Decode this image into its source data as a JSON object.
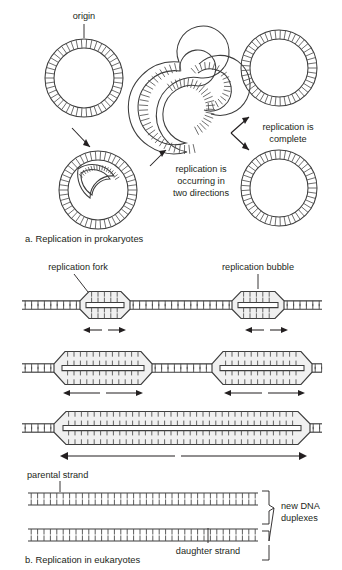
{
  "figure": {
    "title_a": "a. Replication in prokaryotes",
    "title_b": "b. Replication in eukaryotes"
  },
  "panel_a": {
    "labels": {
      "origin": "origin",
      "two_directions_line1": "replication is",
      "two_directions_line2": "occurring in",
      "two_directions_line3": "two directions",
      "complete_line1": "replication is",
      "complete_line2": "complete"
    },
    "stages": [
      {
        "name": "circular-chromosome-origin",
        "state": "intact circular DNA with origin"
      },
      {
        "name": "theta-early",
        "state": "small replication bubble opening"
      },
      {
        "name": "theta-late",
        "state": "bidirectional replication in progress"
      },
      {
        "name": "daughter-circle-top",
        "state": "completed circular daughter DNA"
      },
      {
        "name": "daughter-circle-bottom",
        "state": "completed circular daughter DNA"
      }
    ]
  },
  "panel_b": {
    "labels": {
      "replication_fork": "replication fork",
      "replication_bubble": "replication bubble",
      "parental_strand": "parental strand",
      "daughter_strand": "daughter strand",
      "new_duplexes_line1": "new DNA",
      "new_duplexes_line2": "duplexes"
    },
    "rows": [
      {
        "name": "row-small-bubbles",
        "bubbles": 2,
        "arrows": 2,
        "arrow_span": "short"
      },
      {
        "name": "row-medium-bubbles",
        "bubbles": 2,
        "arrows": 2,
        "arrow_span": "medium"
      },
      {
        "name": "row-merged-bubble",
        "bubbles": 1,
        "arrows": 1,
        "arrow_span": "long"
      },
      {
        "name": "row-separated-duplexes",
        "bubbles": 0,
        "arrows": 0,
        "arrow_span": "none"
      }
    ]
  },
  "colors": {
    "ink": "#231f20",
    "stroke": "#3d3d3d",
    "tick": "#4a4a4a",
    "bubble_fill": "#f0f0f0",
    "background": "#ffffff"
  }
}
